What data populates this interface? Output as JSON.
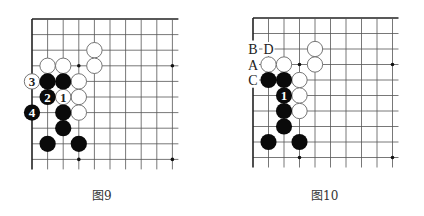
{
  "figures": [
    {
      "id": "left",
      "caption": "图9",
      "origin": {
        "x": 32,
        "y": 19
      },
      "spacing": 15.6,
      "cols": 10,
      "rows": 10,
      "extend_right": 6,
      "extend_bottom": 10,
      "star_points": [
        [
          3,
          3
        ],
        [
          9,
          3
        ],
        [
          3,
          9
        ],
        [
          9,
          9
        ]
      ],
      "hidden_edge_rows": [],
      "stones": [
        {
          "color": "white",
          "col": 4,
          "row": 2,
          "label": ""
        },
        {
          "color": "white",
          "col": 4,
          "row": 3,
          "label": ""
        },
        {
          "color": "white",
          "col": 1,
          "row": 3,
          "label": ""
        },
        {
          "color": "white",
          "col": 2,
          "row": 3,
          "label": ""
        },
        {
          "color": "white",
          "col": 3,
          "row": 4,
          "label": ""
        },
        {
          "color": "white",
          "col": 3,
          "row": 5,
          "label": ""
        },
        {
          "color": "white",
          "col": 3,
          "row": 6,
          "label": ""
        },
        {
          "color": "white",
          "col": 0,
          "row": 4,
          "label": "3"
        },
        {
          "color": "white",
          "col": 2,
          "row": 5,
          "label": "1"
        },
        {
          "color": "black",
          "col": 1,
          "row": 4,
          "label": ""
        },
        {
          "color": "black",
          "col": 2,
          "row": 4,
          "label": ""
        },
        {
          "color": "black",
          "col": 1,
          "row": 5,
          "label": "2"
        },
        {
          "color": "black",
          "col": 0,
          "row": 6,
          "label": "4"
        },
        {
          "color": "black",
          "col": 2,
          "row": 6,
          "label": ""
        },
        {
          "color": "black",
          "col": 2,
          "row": 7,
          "label": ""
        },
        {
          "color": "black",
          "col": 1,
          "row": 8,
          "label": ""
        },
        {
          "color": "black",
          "col": 3,
          "row": 8,
          "label": ""
        }
      ],
      "letters": []
    },
    {
      "id": "right",
      "caption": "图10",
      "origin": {
        "x": 41,
        "y": 18
      },
      "spacing": 15.5,
      "cols": 10,
      "rows": 10,
      "extend_right": 6,
      "extend_bottom": 10,
      "star_points": [
        [
          3,
          3
        ],
        [
          9,
          3
        ],
        [
          3,
          9
        ],
        [
          9,
          9
        ]
      ],
      "hidden_edge_rows": [
        2,
        3,
        4
      ],
      "stones": [
        {
          "color": "white",
          "col": 4,
          "row": 2,
          "label": ""
        },
        {
          "color": "white",
          "col": 4,
          "row": 3,
          "label": ""
        },
        {
          "color": "white",
          "col": 1,
          "row": 3,
          "label": ""
        },
        {
          "color": "white",
          "col": 2,
          "row": 3,
          "label": ""
        },
        {
          "color": "white",
          "col": 3,
          "row": 4,
          "label": ""
        },
        {
          "color": "white",
          "col": 3,
          "row": 5,
          "label": ""
        },
        {
          "color": "white",
          "col": 3,
          "row": 6,
          "label": ""
        },
        {
          "color": "black",
          "col": 1,
          "row": 4,
          "label": ""
        },
        {
          "color": "black",
          "col": 2,
          "row": 4,
          "label": ""
        },
        {
          "color": "black",
          "col": 2,
          "row": 5,
          "label": "1"
        },
        {
          "color": "black",
          "col": 2,
          "row": 6,
          "label": ""
        },
        {
          "color": "black",
          "col": 2,
          "row": 7,
          "label": ""
        },
        {
          "color": "black",
          "col": 1,
          "row": 8,
          "label": ""
        },
        {
          "color": "black",
          "col": 3,
          "row": 8,
          "label": ""
        }
      ],
      "letters": [
        {
          "text": "B",
          "col": 0,
          "row": 2
        },
        {
          "text": "D",
          "col": 1,
          "row": 2
        },
        {
          "text": "A",
          "col": 0,
          "row": 3
        },
        {
          "text": "C",
          "col": 0,
          "row": 4
        }
      ]
    }
  ],
  "colors": {
    "grid": "#555555",
    "edge": "#222222",
    "black_stone": "#0a0a0a",
    "white_stone": "#ffffff",
    "white_stroke": "#666666"
  }
}
